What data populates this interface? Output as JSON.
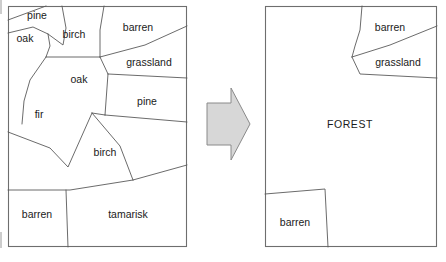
{
  "figure": {
    "title_visible": false,
    "background_color": "#ffffff",
    "line_color": "#5a5a5a",
    "border_color": "#6e6e6e",
    "text_color": "#1a1a1a",
    "arrow_fill": "#d7d7d7",
    "arrow_stroke": "#8a8a8a"
  },
  "maps": {
    "left": {
      "name": "detailed-vegetation-map",
      "box": {
        "x": 8,
        "y": 6,
        "width": 179,
        "height": 241
      },
      "parcels": [
        {
          "id": "pine-top",
          "label": "pine",
          "lx": 37,
          "ly": 15
        },
        {
          "id": "oak-top",
          "label": "oak",
          "lx": 25,
          "ly": 38
        },
        {
          "id": "birch-top",
          "label": "birch",
          "lx": 74,
          "ly": 34
        },
        {
          "id": "barren-top",
          "label": "barren",
          "lx": 138,
          "ly": 27
        },
        {
          "id": "grassland",
          "label": "grassland",
          "lx": 149,
          "ly": 62
        },
        {
          "id": "oak-mid",
          "label": "oak",
          "lx": 79,
          "ly": 79
        },
        {
          "id": "pine-right",
          "label": "pine",
          "lx": 147,
          "ly": 101
        },
        {
          "id": "fir",
          "label": "fir",
          "lx": 39,
          "ly": 114
        },
        {
          "id": "birch-mid",
          "label": "birch",
          "lx": 105,
          "ly": 152
        },
        {
          "id": "barren-bot",
          "label": "barren",
          "lx": 37,
          "ly": 214
        },
        {
          "id": "tamarisk",
          "label": "tamarisk",
          "lx": 128,
          "ly": 214
        }
      ],
      "boundaries": [
        "M 8 20 L 27 13 L 46 6",
        "M 8 33 L 33 27 L 48 34",
        "M 48 34 L 50 46 L 46 57",
        "M 46 57 L 100 57",
        "M 62 6 L 66 28 L 63 45 L 48 34",
        "M 104 6 L 100 30 L 100 57",
        "M 100 57 L 145 45 L 187 26",
        "M 100 57 L 108 74",
        "M 108 74 L 187 78",
        "M 108 74 L 105 115",
        "M 105 115 L 187 122",
        "M 46 57 L 30 80 L 24 101 L 22 124",
        "M 92 113 L 105 115",
        "M 8 132 L 50 148 L 68 167 L 92 113",
        "M 92 113 L 120 146 L 133 180",
        "M 133 180 L 187 165",
        "M 133 180 L 70 190 L 8 190",
        "M 66 190 L 68 247"
      ]
    },
    "right": {
      "name": "generalized-vegetation-map",
      "box": {
        "x": 265,
        "y": 6,
        "width": 172,
        "height": 241
      },
      "parcels": [
        {
          "id": "barren-top",
          "label": "barren",
          "lx": 390,
          "ly": 27
        },
        {
          "id": "grassland",
          "label": "grassland",
          "lx": 398,
          "ly": 62
        },
        {
          "id": "forest",
          "label": "FOREST",
          "lx": 350,
          "ly": 124
        },
        {
          "id": "barren-bot",
          "label": "barren",
          "lx": 295,
          "ly": 222
        }
      ],
      "boundaries": [
        "M 362 6 L 360 30 L 355 46 L 352 57",
        "M 352 57 L 390 45 L 437 26",
        "M 352 57 L 360 74 L 437 78",
        "M 265 194 L 325 189 L 328 247"
      ]
    }
  },
  "arrow": {
    "name": "transform-arrow",
    "direction": "right",
    "points": "207,103 231,103 231,88 250,124 231,160 231,145 207,145"
  }
}
